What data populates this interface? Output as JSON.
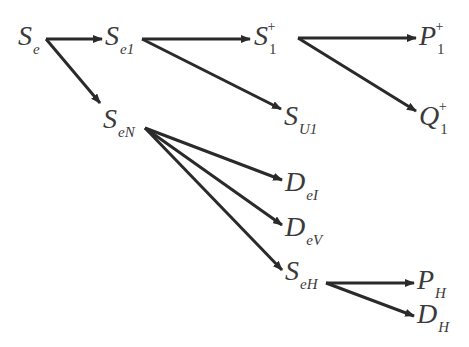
{
  "diagram": {
    "nodes": [
      {
        "id": "Se",
        "base": "S",
        "sub": "e",
        "sup": "",
        "x": 18,
        "y": 22
      },
      {
        "id": "Se1",
        "base": "S",
        "sub": "e1",
        "sup": "",
        "x": 105,
        "y": 22
      },
      {
        "id": "S1p",
        "base": "S",
        "sub": "1",
        "sup": "+",
        "x": 254,
        "y": 22
      },
      {
        "id": "P1p",
        "base": "P",
        "sub": "1",
        "sup": "+",
        "x": 419,
        "y": 22
      },
      {
        "id": "SU1",
        "base": "S",
        "sub": "U1",
        "sup": "",
        "x": 284,
        "y": 102
      },
      {
        "id": "Q1p",
        "base": "Q",
        "sub": "1",
        "sup": "+",
        "x": 419,
        "y": 102
      },
      {
        "id": "SeN",
        "base": "S",
        "sub": "eN",
        "sup": "",
        "x": 103,
        "y": 105
      },
      {
        "id": "DeI",
        "base": "D",
        "sub": "eI",
        "sup": "",
        "x": 285,
        "y": 168
      },
      {
        "id": "DeV",
        "base": "D",
        "sub": "eV",
        "sup": "",
        "x": 285,
        "y": 213
      },
      {
        "id": "SeH",
        "base": "S",
        "sub": "eH",
        "sup": "",
        "x": 285,
        "y": 257
      },
      {
        "id": "PH",
        "base": "P",
        "sub": "H",
        "sup": "",
        "x": 417,
        "y": 266
      },
      {
        "id": "DH",
        "base": "D",
        "sub": "H",
        "sup": "",
        "x": 417,
        "y": 300
      }
    ],
    "edges": [
      {
        "from": "Se",
        "to": "Se1",
        "x1": 46,
        "y1": 39,
        "x2": 102,
        "y2": 39
      },
      {
        "from": "Se",
        "to": "SeN",
        "x1": 46,
        "y1": 39,
        "x2": 100,
        "y2": 103
      },
      {
        "from": "Se1",
        "to": "S1p",
        "x1": 142,
        "y1": 39,
        "x2": 250,
        "y2": 39
      },
      {
        "from": "Se1",
        "to": "SU1",
        "x1": 142,
        "y1": 39,
        "x2": 281,
        "y2": 109
      },
      {
        "from": "S1p",
        "to": "P1p",
        "x1": 298,
        "y1": 38,
        "x2": 416,
        "y2": 38
      },
      {
        "from": "S1p",
        "to": "Q1p",
        "x1": 298,
        "y1": 38,
        "x2": 416,
        "y2": 111
      },
      {
        "from": "SeN",
        "to": "DeI",
        "x1": 145,
        "y1": 128,
        "x2": 282,
        "y2": 180
      },
      {
        "from": "SeN",
        "to": "DeV",
        "x1": 145,
        "y1": 128,
        "x2": 282,
        "y2": 225
      },
      {
        "from": "SeN",
        "to": "SeH",
        "x1": 145,
        "y1": 128,
        "x2": 282,
        "y2": 270
      },
      {
        "from": "SeH",
        "to": "PH",
        "x1": 326,
        "y1": 283,
        "x2": 414,
        "y2": 283
      },
      {
        "from": "SeH",
        "to": "DH",
        "x1": 326,
        "y1": 283,
        "x2": 414,
        "y2": 316
      }
    ]
  }
}
